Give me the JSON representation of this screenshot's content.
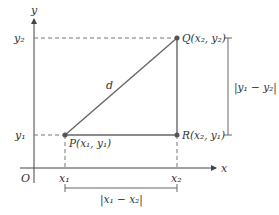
{
  "diagram": {
    "axes": {
      "x_label": "x",
      "y_label": "y",
      "origin_label": "O"
    },
    "ticks": {
      "x1": "x₁",
      "x2": "x₂",
      "y1": "y₁",
      "y2": "y₂"
    },
    "points": {
      "P": {
        "label": "P(x₁, y₁)"
      },
      "Q": {
        "label": "Q(x₂, y₂)"
      },
      "R": {
        "label": "R(x₂, y₁)"
      }
    },
    "hypotenuse_label": "d",
    "horizontal_distance_label": "|x₁ − x₂|",
    "vertical_distance_label": "|y₁ − y₂|",
    "colors": {
      "line": "#555555",
      "point": "#555555",
      "dashed": "#777777",
      "axis": "#444444"
    }
  }
}
